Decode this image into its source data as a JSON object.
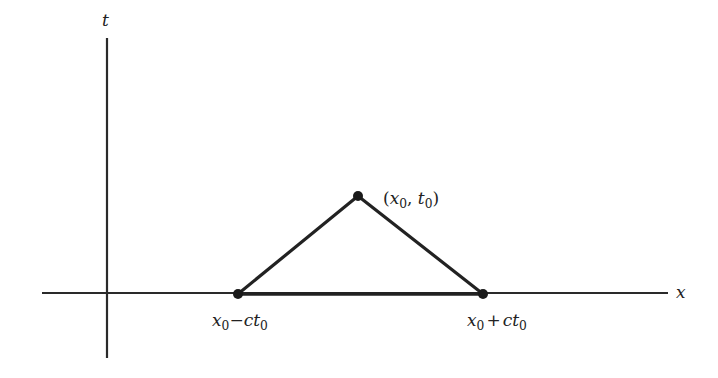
{
  "diagram": {
    "type": "characteristic-triangle",
    "axes": {
      "horizontal": {
        "label": "x"
      },
      "vertical": {
        "label": "t"
      }
    },
    "points": [
      {
        "id": "apex",
        "label": {
          "open": "(",
          "x_var": "x",
          "x_sub": "0",
          "sep": ", ",
          "t_var": "t",
          "t_sub": "0",
          "close": ")"
        }
      },
      {
        "id": "left-foot",
        "label": {
          "var1": "x",
          "sub1": "0",
          "op": "−",
          "coef": "c",
          "var2": "t",
          "sub2": "0"
        }
      },
      {
        "id": "right-foot",
        "label": {
          "var1": "x",
          "sub1": "0",
          "op": "+",
          "coef": "c",
          "var2": "t",
          "sub2": "0"
        }
      }
    ],
    "colors": {
      "line": "#222222",
      "background": "#ffffff"
    }
  }
}
